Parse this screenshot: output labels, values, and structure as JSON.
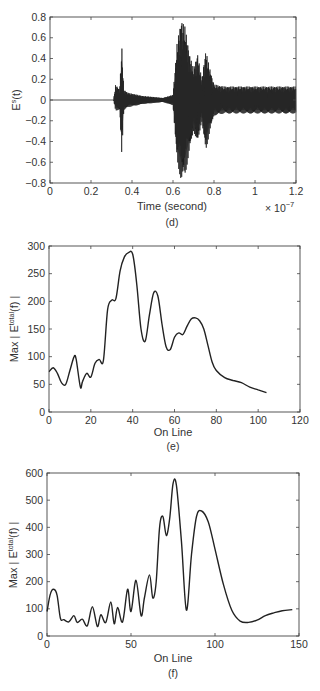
{
  "chart_data": [
    {
      "id": "d",
      "type": "line",
      "caption": "(d)",
      "title": "",
      "xlabel": "Time (second)",
      "x_multiplier": "× 10^-7",
      "x_multiplier_base": "× 10",
      "x_multiplier_exp": "−7",
      "ylabel_main": "E",
      "ylabel_sup": "s",
      "ylabel_tail": "(t)",
      "xlim": [
        0,
        1.2
      ],
      "ylim": [
        -0.8,
        0.8
      ],
      "xticks": [
        "0",
        "0.2",
        "0.4",
        "0.6",
        "0.8",
        "1",
        "1.2"
      ],
      "yticks": [
        "0.8",
        "0.6",
        "0.4",
        "0.2",
        "0",
        "−0.2",
        "−0.4",
        "−0.6",
        "−0.8"
      ],
      "description": "Oscillating time-domain signal: flat zero until ~0.31, burst 0.31-0.6 with spike ±0.53 near 0.35, large burst 0.6-0.8 peaking ±0.78 near 0.64, sustained oscillation ±0.13 from 0.8 to 1.2",
      "envelope": {
        "x": [
          0,
          0.31,
          0.32,
          0.34,
          0.35,
          0.36,
          0.38,
          0.45,
          0.55,
          0.6,
          0.62,
          0.64,
          0.66,
          0.68,
          0.7,
          0.72,
          0.74,
          0.76,
          0.78,
          0.8,
          0.85,
          1.0,
          1.2
        ],
        "upper": [
          0,
          0,
          0.15,
          0.1,
          0.53,
          0.1,
          0.07,
          0.04,
          0.02,
          0.05,
          0.55,
          0.78,
          0.7,
          0.45,
          0.3,
          0.45,
          0.2,
          0.48,
          0.3,
          0.15,
          0.13,
          0.13,
          0.13
        ],
        "lower": [
          0,
          0,
          -0.1,
          -0.1,
          -0.53,
          -0.1,
          -0.07,
          -0.04,
          -0.02,
          -0.05,
          -0.6,
          -0.78,
          -0.72,
          -0.5,
          -0.3,
          -0.42,
          -0.2,
          -0.5,
          -0.3,
          -0.15,
          -0.13,
          -0.13,
          -0.13
        ]
      }
    },
    {
      "id": "e",
      "type": "line",
      "caption": "(e)",
      "title": "",
      "xlabel": "On Line",
      "ylabel_main": "Max | E",
      "ylabel_sup": "total",
      "ylabel_tail": "(f) |",
      "xlim": [
        0,
        120
      ],
      "ylim": [
        0,
        300
      ],
      "xticks": [
        "0",
        "20",
        "40",
        "60",
        "80",
        "100",
        "120"
      ],
      "yticks": [
        "300",
        "250",
        "200",
        "150",
        "100",
        "50",
        "0"
      ],
      "x": [
        0,
        2,
        4,
        6,
        8,
        10,
        12,
        13,
        15,
        16,
        18,
        20,
        22,
        24,
        26,
        28,
        30,
        32,
        34,
        36,
        38,
        40,
        42,
        44,
        46,
        48,
        50,
        52,
        54,
        56,
        58,
        60,
        62,
        64,
        66,
        68,
        70,
        72,
        74,
        76,
        78,
        80,
        84,
        88,
        92,
        96,
        100,
        104
      ],
      "y": [
        73,
        80,
        70,
        53,
        50,
        75,
        100,
        95,
        45,
        55,
        70,
        63,
        88,
        95,
        93,
        185,
        202,
        205,
        255,
        280,
        288,
        285,
        230,
        150,
        128,
        175,
        215,
        210,
        160,
        118,
        113,
        135,
        143,
        140,
        155,
        168,
        170,
        165,
        150,
        120,
        90,
        75,
        62,
        57,
        53,
        45,
        40,
        35
      ]
    },
    {
      "id": "f",
      "type": "line",
      "caption": "(f)",
      "title": "",
      "xlabel": "On Line",
      "ylabel_main": "Max | E",
      "ylabel_sup": "total",
      "ylabel_tail": "(f) |",
      "xlim": [
        0,
        150
      ],
      "ylim": [
        0,
        600
      ],
      "xticks": [
        "0",
        "50",
        "100",
        "150"
      ],
      "yticks": [
        "600",
        "500",
        "400",
        "300",
        "200",
        "100",
        "0"
      ],
      "x": [
        0,
        2,
        4,
        6,
        8,
        10,
        13,
        16,
        18,
        21,
        24,
        27,
        30,
        32,
        35,
        38,
        40,
        42,
        45,
        48,
        50,
        53,
        56,
        58,
        61,
        63,
        65,
        67,
        69,
        71,
        73,
        75,
        77,
        80,
        83,
        86,
        89,
        92,
        96,
        100,
        105,
        110,
        115,
        120,
        125,
        130,
        135,
        140,
        146
      ],
      "y": [
        90,
        155,
        172,
        150,
        65,
        60,
        52,
        75,
        50,
        62,
        38,
        108,
        35,
        78,
        50,
        125,
        45,
        105,
        52,
        172,
        90,
        205,
        75,
        140,
        225,
        140,
        200,
        400,
        440,
        370,
        430,
        560,
        555,
        350,
        95,
        300,
        440,
        460,
        420,
        320,
        190,
        95,
        55,
        50,
        58,
        75,
        85,
        93,
        97
      ]
    }
  ]
}
